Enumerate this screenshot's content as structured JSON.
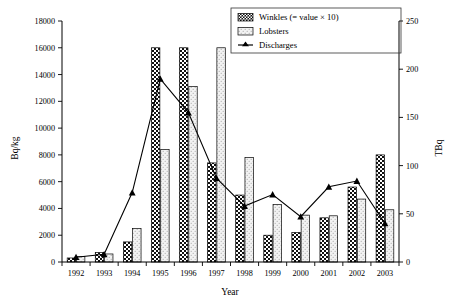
{
  "chart_data": {
    "type": "bar",
    "title": "",
    "subtitle": "",
    "xlabel": "Year",
    "ylabel": "Bq/kg",
    "y2label": "TBq",
    "categories": [
      "1992",
      "1993",
      "1994",
      "1995",
      "1996",
      "1997",
      "1998",
      "1999",
      "2000",
      "2001",
      "2002",
      "2003"
    ],
    "ylim": [
      0,
      18000
    ],
    "y2lim": [
      0,
      250
    ],
    "yticks": [
      0,
      2000,
      4000,
      6000,
      8000,
      10000,
      12000,
      14000,
      16000,
      18000
    ],
    "ytick_labels": [
      "0",
      "2000",
      "4000",
      "6000",
      "8000",
      "10000",
      "12000",
      "14000",
      "16000",
      "18000"
    ],
    "y2ticks": [
      0,
      50,
      100,
      150,
      200,
      250
    ],
    "y2tick_labels": [
      "0",
      "50",
      "100",
      "150",
      "200",
      "250"
    ],
    "grid": false,
    "legend_position": "top-right",
    "series": [
      {
        "name": "Winkles (= value × 10)",
        "type": "bar",
        "axis": "left",
        "pattern": "dark-checker",
        "values": [
          300,
          700,
          1500,
          16000,
          16000,
          7400,
          5000,
          2000,
          2200,
          3300,
          5600,
          8000
        ]
      },
      {
        "name": "Lobsters",
        "type": "bar",
        "axis": "left",
        "pattern": "light-dotted",
        "values": [
          400,
          600,
          2500,
          8400,
          13100,
          16000,
          7800,
          4300,
          3500,
          3450,
          4700,
          3900
        ]
      },
      {
        "name": "Discharges",
        "type": "line",
        "axis": "right",
        "marker": "triangle",
        "values": [
          5,
          8,
          72,
          190,
          155,
          87,
          58,
          70,
          47,
          78,
          84,
          40
        ]
      }
    ]
  },
  "legend": {
    "items": [
      {
        "label": "Winkles (= value × 10)",
        "swatch": "dark-checker-swatch"
      },
      {
        "label": "Lobsters",
        "swatch": "light-dotted-swatch"
      },
      {
        "label": "Discharges",
        "swatch": "line-marker-swatch"
      }
    ]
  },
  "axes": {
    "left_title": "Bq/kg",
    "right_title": "TBq",
    "bottom_title": "Year"
  },
  "colors": {
    "axis": "#000000",
    "bar_dark": "#1a1a1a",
    "bar_light": "#efefef",
    "line": "#000000",
    "background": "#ffffff"
  }
}
